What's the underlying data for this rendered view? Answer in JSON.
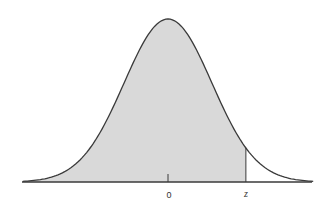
{
  "chart_data": {
    "type": "area",
    "title": "",
    "subtitle": "",
    "xlabel": "",
    "ylabel": "",
    "distribution": "standard normal",
    "mean": 0,
    "sd": 1,
    "xlim": [
      -3.3,
      3.3
    ],
    "ylim": [
      0,
      0.4
    ],
    "grid": false,
    "legend": null,
    "shaded_region": {
      "from": "-inf",
      "to": "z",
      "z_value_estimate": 1.77
    },
    "tick_labels": [
      {
        "position": 0,
        "label": "0",
        "style": "normal"
      },
      {
        "position": 1.77,
        "label": "z",
        "style": "italic"
      }
    ],
    "x": [
      -3,
      -2.5,
      -2,
      -1.5,
      -1,
      -0.5,
      0,
      0.5,
      1,
      1.5,
      2,
      2.5,
      3
    ],
    "values": [
      0.0044,
      0.0175,
      0.054,
      0.1295,
      0.242,
      0.3521,
      0.3989,
      0.3521,
      0.242,
      0.1295,
      0.054,
      0.0175,
      0.0044
    ]
  },
  "colors": {
    "curve": "#3a3a3a",
    "fill": "#d9d9d9",
    "axis": "#3a3a3a",
    "background": "#ffffff",
    "label": "#333333"
  },
  "geometry": {
    "baseline_y": 182,
    "axis_x_start": 22,
    "axis_x_end": 312,
    "center_x": 168,
    "peak_y": 19,
    "sigma_px": 44,
    "tick_zero_top": 174,
    "label_y": 190
  }
}
